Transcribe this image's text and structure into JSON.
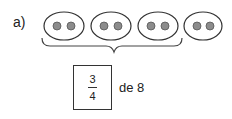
{
  "exercise": {
    "label": "a)",
    "groups": [
      {
        "dots": 2,
        "bracketed": true
      },
      {
        "dots": 2,
        "bracketed": true
      },
      {
        "dots": 2,
        "bracketed": true
      },
      {
        "dots": 2,
        "bracketed": false
      }
    ],
    "fraction": {
      "numerator": "3",
      "denominator": "4"
    },
    "suffix": "de 8",
    "colors": {
      "dot": "#8c8c8c",
      "stroke": "#333333"
    }
  }
}
